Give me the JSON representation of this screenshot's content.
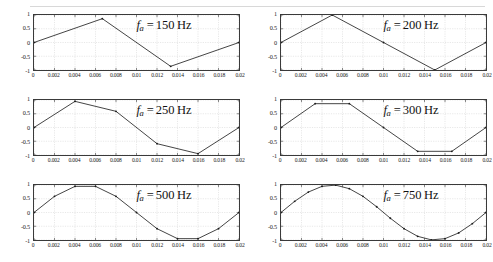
{
  "figure": {
    "title": "",
    "panel_count": 6,
    "rows": 2,
    "cols": 3
  },
  "axes": {
    "x_ticks": [
      "0",
      "0.002",
      "0.004",
      "0.006",
      "0.008",
      "0.01",
      "0.012",
      "0.014",
      "0.016",
      "0.018",
      "0.02"
    ],
    "x_tick_values": [
      0,
      0.002,
      0.004,
      0.006,
      0.008,
      0.01,
      0.012,
      0.014,
      0.016,
      0.018,
      0.02
    ],
    "y_ticks": [
      "1",
      "0.5",
      "0",
      "-0.5",
      "-1"
    ],
    "y_tick_values": [
      1,
      0.5,
      0,
      -0.5,
      -1
    ],
    "xlim": [
      0,
      0.02
    ],
    "ylim": [
      -1,
      1
    ],
    "grid": true,
    "xlabel": "",
    "ylabel": ""
  },
  "style": {
    "line_color": "#2b2b2b",
    "marker_color": "#1a1a1a",
    "grid_color": "#d0d0d0",
    "axis_color": "#3a3a3a",
    "background": "#ffffff",
    "text_color": "#1a1a1a"
  },
  "chart_data": [
    {
      "type": "line",
      "id": "panel-150hz",
      "title": "f_a = 150 Hz",
      "annotation": {
        "symbol": "f",
        "subscript": "a",
        "equals": "=",
        "value": "150",
        "unit": "Hz"
      },
      "xlabel": "",
      "ylabel": "",
      "xlim": [
        0,
        0.02
      ],
      "ylim": [
        -1,
        1
      ],
      "grid": true,
      "marker": "dot",
      "x": [
        0,
        0.0066667,
        0.0133333,
        0.02
      ],
      "y": [
        0,
        0.866,
        -0.866,
        0
      ]
    },
    {
      "type": "line",
      "id": "panel-200hz",
      "title": "f_a = 200 Hz",
      "annotation": {
        "symbol": "f",
        "subscript": "a",
        "equals": "=",
        "value": "200",
        "unit": "Hz"
      },
      "xlabel": "",
      "ylabel": "",
      "xlim": [
        0,
        0.02
      ],
      "ylim": [
        -1,
        1
      ],
      "grid": true,
      "marker": "dot",
      "x": [
        0,
        0.005,
        0.01,
        0.015,
        0.02
      ],
      "y": [
        0,
        1,
        0,
        -1,
        0
      ]
    },
    {
      "type": "line",
      "id": "panel-250hz",
      "title": "f_a = 250 Hz",
      "annotation": {
        "symbol": "f",
        "subscript": "a",
        "equals": "=",
        "value": "250",
        "unit": "Hz"
      },
      "xlabel": "",
      "ylabel": "",
      "xlim": [
        0,
        0.02
      ],
      "ylim": [
        -1,
        1
      ],
      "grid": true,
      "marker": "dot",
      "x": [
        0,
        0.004,
        0.008,
        0.012,
        0.016,
        0.02
      ],
      "y": [
        0,
        0.951,
        0.588,
        -0.588,
        -0.951,
        0
      ]
    },
    {
      "type": "line",
      "id": "panel-300hz",
      "title": "f_a = 300 Hz",
      "annotation": {
        "symbol": "f",
        "subscript": "a",
        "equals": "=",
        "value": "300",
        "unit": "Hz"
      },
      "xlabel": "",
      "ylabel": "",
      "xlim": [
        0,
        0.02
      ],
      "ylim": [
        -1,
        1
      ],
      "grid": true,
      "marker": "dot",
      "x": [
        0,
        0.0033333,
        0.0066667,
        0.01,
        0.0133333,
        0.0166667,
        0.02
      ],
      "y": [
        0,
        0.866,
        0.866,
        0,
        -0.866,
        -0.866,
        0
      ]
    },
    {
      "type": "line",
      "id": "panel-500hz",
      "title": "f_a = 500 Hz",
      "annotation": {
        "symbol": "f",
        "subscript": "a",
        "equals": "=",
        "value": "500",
        "unit": "Hz"
      },
      "xlabel": "",
      "ylabel": "",
      "xlim": [
        0,
        0.02
      ],
      "ylim": [
        -1,
        1
      ],
      "grid": true,
      "marker": "dot",
      "x": [
        0,
        0.002,
        0.004,
        0.006,
        0.008,
        0.01,
        0.012,
        0.014,
        0.016,
        0.018,
        0.02
      ],
      "y": [
        0,
        0.588,
        0.951,
        0.951,
        0.588,
        0,
        -0.588,
        -0.951,
        -0.951,
        -0.588,
        0
      ]
    },
    {
      "type": "line",
      "id": "panel-750hz",
      "title": "f_a = 750 Hz",
      "annotation": {
        "symbol": "f",
        "subscript": "a",
        "equals": "=",
        "value": "750",
        "unit": "Hz"
      },
      "xlabel": "",
      "ylabel": "",
      "xlim": [
        0,
        0.02
      ],
      "ylim": [
        -1,
        1
      ],
      "grid": true,
      "marker": "dot",
      "x": [
        0,
        0.0013333,
        0.0026667,
        0.004,
        0.0053333,
        0.0066667,
        0.008,
        0.0093333,
        0.0106667,
        0.012,
        0.0133333,
        0.0146667,
        0.016,
        0.0173333,
        0.0186667,
        0.02
      ],
      "y": [
        0,
        0.4067,
        0.7431,
        0.9511,
        0.9945,
        0.866,
        0.5878,
        0.2079,
        -0.2079,
        -0.5878,
        -0.866,
        -0.9945,
        -0.9511,
        -0.7431,
        -0.4067,
        0
      ]
    }
  ]
}
